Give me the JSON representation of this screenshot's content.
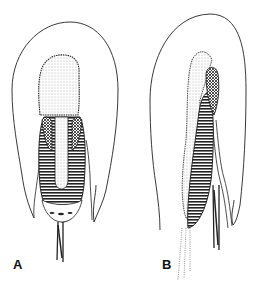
{
  "figure": {
    "panels": [
      {
        "id": "A",
        "label": "A"
      },
      {
        "id": "B",
        "label": "B"
      }
    ]
  },
  "colors": {
    "line": "#222222",
    "background": "#ffffff"
  }
}
